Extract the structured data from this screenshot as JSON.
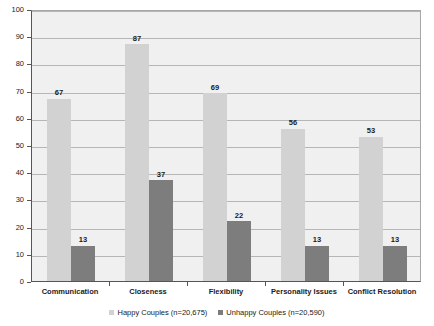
{
  "chart_data": {
    "type": "bar",
    "title": "",
    "subtitle": "",
    "xlabel": "",
    "ylabel": "",
    "ylim": [
      0,
      100
    ],
    "yticks": [
      0,
      10,
      20,
      30,
      40,
      50,
      60,
      70,
      80,
      90,
      100
    ],
    "ytick_labels": [
      "0",
      "10",
      "20",
      "30",
      "40",
      "50",
      "60",
      "70",
      "80",
      "90",
      "100"
    ],
    "grid": true,
    "legend_position": "bottom",
    "categories": [
      "Communication",
      "Closeness",
      "Flexibility",
      "Personality Issues",
      "Conflict Resolution"
    ],
    "series": [
      {
        "name": "Happy Couples (n=20,675)",
        "color": "#d2d2d2",
        "values": [
          67,
          87,
          69,
          56,
          53
        ],
        "value_labels": [
          "67",
          "87",
          "69",
          "56",
          "53"
        ]
      },
      {
        "name": "Unhappy Couples (n=20,590)",
        "color": "#7d7d7d",
        "values": [
          13,
          37,
          22,
          13,
          13
        ],
        "value_labels": [
          "13",
          "37",
          "22",
          "13",
          "13"
        ]
      }
    ]
  },
  "legend": {
    "items": [
      {
        "label": "Happy Couples (n=20,675)",
        "swatch": "happy"
      },
      {
        "label": "Unhappy Couples (n=20,590)",
        "swatch": "unhappy"
      }
    ]
  },
  "colors": {
    "happy": "#d2d2d2",
    "unhappy": "#7d7d7d",
    "plot_background": "#f0f0f0",
    "gridline": "#b6b6b6",
    "axis": "#555555",
    "text": "#1a1a1a"
  }
}
